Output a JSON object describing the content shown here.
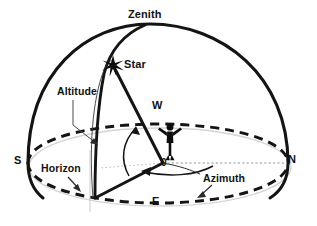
{
  "diagram": {
    "type": "celestial-sphere-diagram",
    "colors": {
      "stroke": "#111111",
      "fill_background": "#ffffff",
      "axis_guide": "#b9b9b9",
      "shadow_outline": "#cfcfcf"
    },
    "labels": {
      "zenith": "Zenith",
      "star": "Star",
      "altitude": "Altitude",
      "horizon": "Horizon",
      "azimuth": "Azimuth",
      "north": "N",
      "south": "S",
      "east": "E",
      "west": "W",
      "origin": "0"
    },
    "icons": {
      "star_marker": "star-burst-icon",
      "observer": "observer-figure-icon"
    },
    "geometry": {
      "zenith_point": [
        145,
        25
      ],
      "star_point": [
        113,
        66
      ],
      "origin_point": [
        163,
        163
      ],
      "horizon_foot_point": [
        95,
        198
      ],
      "north_point": [
        287,
        163
      ],
      "south_point": [
        28,
        163
      ],
      "east_point": [
        158,
        203
      ],
      "west_point": [
        158,
        123
      ]
    }
  }
}
